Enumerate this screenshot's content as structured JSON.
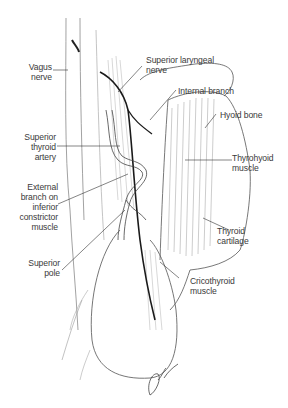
{
  "figure": {
    "labels": {
      "vagus_nerve": "Vagus\nnerve",
      "superior_laryngeal_nerve": "Superior laryngeal\nnerve",
      "internal_branch": "Internal branch",
      "hyoid_bone": "Hyoid bone",
      "superior_thyroid_artery": "Superior\nthyroid\nartery",
      "thyrohyoid_muscle": "Thyrohyoid\nmuscle",
      "external_branch": "External\nbranch on\ninferior\nconstrictor\nmuscle",
      "thyroid_cartilage": "Thyroid\ncartilage",
      "superior_pole": "Superior\npole",
      "cricothyroid_muscle": "Cricothyroid\nmuscle"
    },
    "signature": "artist-signature",
    "colors": {
      "ink": "#2a2a2a",
      "label": "#3a3a3a",
      "shade": "#bdbdbd",
      "background": "#ffffff"
    }
  }
}
